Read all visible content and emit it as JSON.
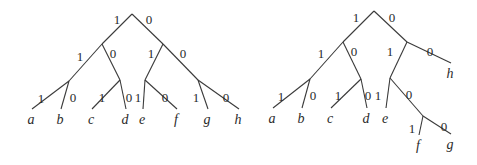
{
  "diagram": {
    "type": "binary-code-trees",
    "colors": {
      "line": "#3a3a3a",
      "text": "#2a2a2a",
      "background": "#ffffff"
    },
    "trees": [
      {
        "name": "left-tree",
        "nodes": {
          "root": [
            132,
            14
          ],
          "n1": [
            102,
            44
          ],
          "n0": [
            163,
            44
          ],
          "n11": [
            69,
            81
          ],
          "n10": [
            120,
            80
          ],
          "n01": [
            145,
            80
          ],
          "n00": [
            198,
            80
          ]
        },
        "edges": [
          {
            "from": "root",
            "to": "n1",
            "label": "1",
            "lx": 117,
            "ly": 24
          },
          {
            "from": "root",
            "to": "n0",
            "label": "0",
            "lx": 149,
            "ly": 24
          },
          {
            "from": "n1",
            "to": "n11",
            "label": "1",
            "lx": 80,
            "ly": 61
          },
          {
            "from": "n1",
            "to": "n10",
            "label": "0",
            "lx": 113,
            "ly": 58
          },
          {
            "from": "n0",
            "to": "n01",
            "label": "1",
            "lx": 151,
            "ly": 58
          },
          {
            "from": "n0",
            "to": "n00",
            "label": "0",
            "lx": 183,
            "ly": 58
          }
        ],
        "leaves": [
          {
            "from": "n11",
            "label": "1",
            "lx": 41,
            "ly": 103,
            "symbol": "a",
            "x": 31,
            "y": 121
          },
          {
            "from": "n11",
            "label": "0",
            "lx": 73,
            "ly": 102,
            "symbol": "b",
            "x": 60,
            "y": 121
          },
          {
            "from": "n10",
            "label": "1",
            "lx": 102,
            "ly": 102,
            "symbol": "c",
            "x": 91,
            "y": 121
          },
          {
            "from": "n10",
            "label": "0",
            "lx": 129,
            "ly": 102,
            "symbol": "d",
            "x": 125,
            "y": 121
          },
          {
            "from": "n01",
            "label": "1",
            "lx": 138,
            "ly": 102,
            "symbol": "e",
            "x": 142,
            "y": 121
          },
          {
            "from": "n01",
            "label": "0",
            "lx": 165,
            "ly": 102,
            "symbol": "f",
            "x": 176,
            "y": 121
          },
          {
            "from": "n00",
            "label": "1",
            "lx": 196,
            "ly": 102,
            "symbol": "g",
            "x": 207,
            "y": 121
          },
          {
            "from": "n00",
            "label": "0",
            "lx": 226,
            "ly": 102,
            "symbol": "h",
            "x": 238,
            "y": 121
          }
        ]
      },
      {
        "name": "right-tree",
        "nodes": {
          "root": [
            374,
            11
          ],
          "n1": [
            343,
            42
          ],
          "n0": [
            407,
            42
          ],
          "n11": [
            310,
            79
          ],
          "n10": [
            361,
            79
          ],
          "n01": [
            390,
            78
          ],
          "n010": [
            423,
            116
          ]
        },
        "edges": [
          {
            "from": "root",
            "to": "n1",
            "label": "1",
            "lx": 356,
            "ly": 22
          },
          {
            "from": "root",
            "to": "n0",
            "label": "0",
            "lx": 392,
            "ly": 22
          },
          {
            "from": "n1",
            "to": "n11",
            "label": "1",
            "lx": 321,
            "ly": 58
          },
          {
            "from": "n1",
            "to": "n10",
            "label": "0",
            "lx": 354,
            "ly": 56
          },
          {
            "from": "n0",
            "to": "n01",
            "label": "1",
            "lx": 390,
            "ly": 56
          },
          {
            "from": "n01",
            "to": "n010",
            "label": "0",
            "lx": 409,
            "ly": 99
          }
        ],
        "leaves": [
          {
            "from": "n11",
            "label": "1",
            "lx": 281,
            "ly": 101,
            "symbol": "a",
            "x": 272,
            "y": 120
          },
          {
            "from": "n11",
            "label": "0",
            "lx": 313,
            "ly": 100,
            "symbol": "b",
            "x": 301,
            "y": 120
          },
          {
            "from": "n10",
            "label": "1",
            "lx": 338,
            "ly": 100,
            "symbol": "c",
            "x": 330,
            "y": 120
          },
          {
            "from": "n10",
            "label": "0",
            "lx": 368,
            "ly": 100,
            "symbol": "d",
            "x": 366,
            "y": 120
          },
          {
            "from": "n01",
            "label": "1",
            "lx": 378,
            "ly": 100,
            "symbol": "e",
            "x": 385,
            "y": 120
          },
          {
            "from": "n0",
            "label": "0",
            "lx": 430,
            "ly": 56,
            "symbol": "h",
            "x": 450,
            "y": 75
          },
          {
            "from": "n010",
            "label": "1",
            "lx": 412,
            "ly": 133,
            "symbol": "f",
            "x": 418,
            "y": 147
          },
          {
            "from": "n010",
            "label": "0",
            "lx": 444,
            "ly": 131,
            "symbol": "g",
            "x": 450,
            "y": 146
          }
        ]
      }
    ]
  }
}
